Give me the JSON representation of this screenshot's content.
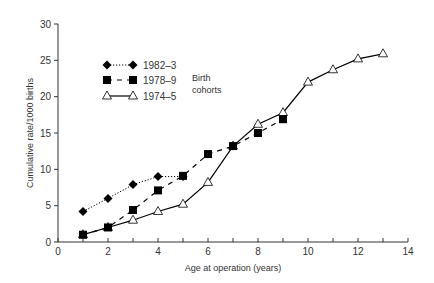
{
  "chart_data": {
    "type": "line",
    "title": "",
    "xlabel": "Age at operation (years)",
    "ylabel": "Cumulative rate/1000 births",
    "xlim": [
      0,
      14
    ],
    "ylim": [
      0,
      30
    ],
    "xticks": [
      0,
      2,
      4,
      6,
      8,
      10,
      12,
      14
    ],
    "xminor_ticks": [
      1,
      3,
      5,
      7,
      9,
      11,
      13
    ],
    "yticks": [
      0,
      5,
      10,
      15,
      20,
      25,
      30
    ],
    "grid": false,
    "legend_position": "upper-left",
    "legend_title": "Birth cohorts",
    "series": [
      {
        "name": "1982–3",
        "marker": "diamond-filled",
        "line": "dotted",
        "x": [
          1,
          2,
          3,
          4,
          5
        ],
        "values": [
          4.2,
          6.0,
          7.9,
          9.0,
          9.0
        ]
      },
      {
        "name": "1978–9",
        "marker": "square-filled",
        "line": "dashed",
        "x": [
          1,
          2,
          3,
          4,
          5,
          6,
          7,
          8,
          9
        ],
        "values": [
          1.0,
          2.0,
          4.4,
          7.1,
          9.1,
          12.1,
          13.2,
          15.0,
          16.9
        ]
      },
      {
        "name": "1974–5",
        "marker": "triangle-open",
        "line": "solid",
        "x": [
          1,
          2,
          3,
          4,
          5,
          6,
          7,
          8,
          9,
          10,
          11,
          12,
          13
        ],
        "values": [
          1.0,
          2.0,
          3.0,
          4.2,
          5.2,
          8.2,
          13.2,
          16.2,
          17.8,
          22.0,
          23.7,
          25.2,
          25.9
        ]
      }
    ]
  },
  "legend": {
    "items": [
      "1982–3",
      "1978–9",
      "1974–5"
    ],
    "title_line1": "Birth",
    "title_line2": "cohorts"
  },
  "axes": {
    "xlabel": "Age at operation (years)",
    "ylabel": "Cumulative rate/1000 births"
  }
}
